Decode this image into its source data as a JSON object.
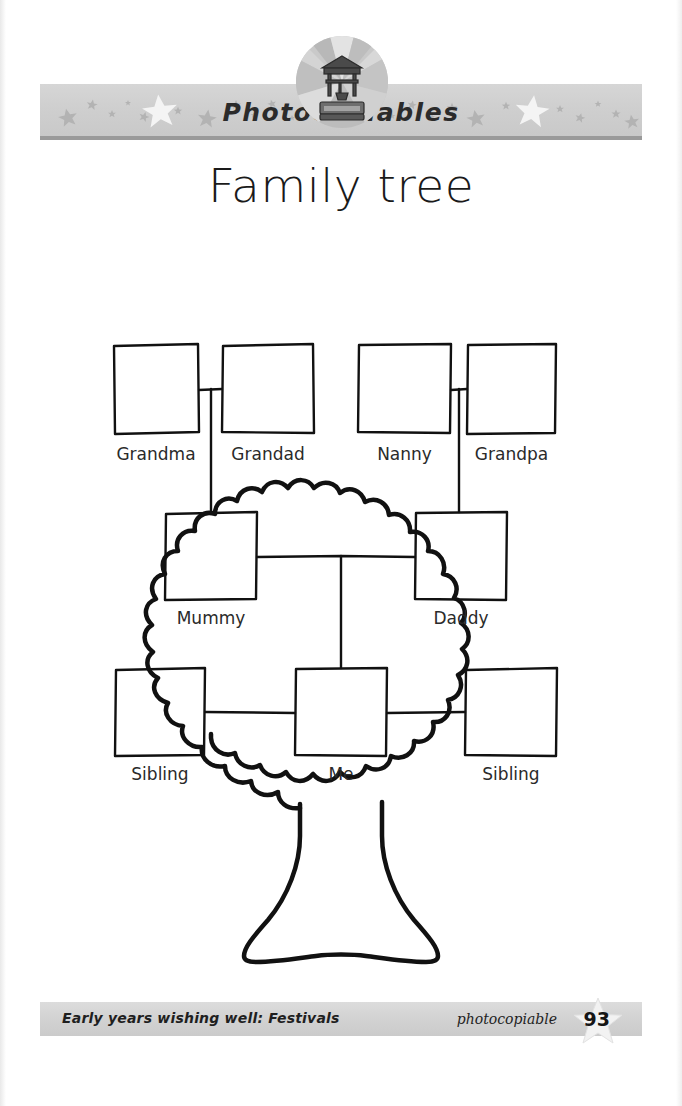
{
  "banner": {
    "title": "Photocopiables",
    "emblem_name": "wishing-well-emblem"
  },
  "sheet": {
    "title": "Family tree"
  },
  "tree": {
    "nodes": [
      {
        "id": "grandma",
        "label": "Grandma",
        "x": 113,
        "y": 344,
        "w": 86,
        "h": 90,
        "label_y": 444
      },
      {
        "id": "grandad",
        "label": "Grandad",
        "x": 222,
        "y": 344,
        "w": 92,
        "h": 90,
        "label_y": 444
      },
      {
        "id": "nanny",
        "label": "Nanny",
        "x": 358,
        "y": 344,
        "w": 93,
        "h": 90,
        "label_y": 444
      },
      {
        "id": "grandpa",
        "label": "Grandpa",
        "x": 467,
        "y": 344,
        "w": 89,
        "h": 90,
        "label_y": 444
      },
      {
        "id": "mummy",
        "label": "Mummy",
        "x": 165,
        "y": 512,
        "w": 92,
        "h": 88,
        "label_y": 608
      },
      {
        "id": "daddy",
        "label": "Daddy",
        "x": 415,
        "y": 512,
        "w": 92,
        "h": 88,
        "label_y": 608
      },
      {
        "id": "sibling-left",
        "label": "Sibling",
        "x": 115,
        "y": 668,
        "w": 90,
        "h": 88,
        "label_y": 764
      },
      {
        "id": "me",
        "label": "Me",
        "x": 295,
        "y": 668,
        "w": 92,
        "h": 88,
        "label_y": 764
      },
      {
        "id": "sibling-right",
        "label": "Sibling",
        "x": 465,
        "y": 668,
        "w": 92,
        "h": 88,
        "label_y": 764
      }
    ],
    "connectors": [
      {
        "from": "grandma",
        "to": "grandad",
        "type": "couple-bar"
      },
      {
        "from": "nanny",
        "to": "grandpa",
        "type": "couple-bar"
      },
      {
        "from": "grandparents-left",
        "to": "mummy",
        "type": "drop"
      },
      {
        "from": "grandparents-right",
        "to": "daddy",
        "type": "drop"
      },
      {
        "from": "mummy",
        "to": "daddy",
        "type": "couple-bar"
      },
      {
        "from": "parents",
        "to": "me",
        "type": "drop"
      },
      {
        "from": "sibling-left",
        "to": "me",
        "type": "sibling-bar"
      },
      {
        "from": "me",
        "to": "sibling-right",
        "type": "sibling-bar"
      }
    ]
  },
  "footer": {
    "source": "Early years wishing well: Festivals",
    "photocopiable": "photocopiable",
    "page_number": "93"
  },
  "colors": {
    "ink": "#231f20",
    "banner_gray": "#cfcfcf",
    "banner_rule": "#9a9a9a",
    "star_gray": "#b5b5b5",
    "footer_gray": "#d2d2d2"
  }
}
